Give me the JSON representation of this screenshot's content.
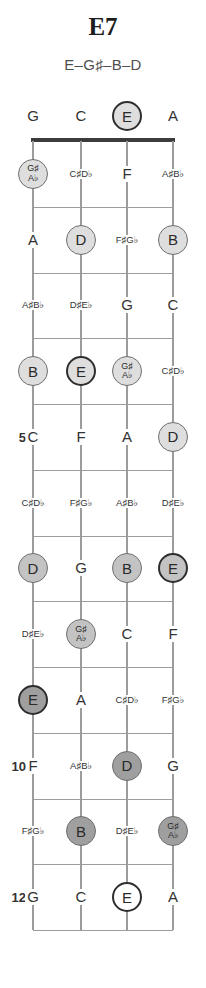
{
  "title": "E7",
  "subtitle": "E–G♯–B–D",
  "colors": {
    "title_text": "#1c1c1c",
    "subtitle_text": "#4f4f4f",
    "text": "#333333",
    "line": "#9c9c9c",
    "nut": "#3c3c3c",
    "light_fill": "#dedede",
    "medium_fill": "#c3c3c3",
    "dark_fill": "#9f9f9f",
    "ring": "#6f6f6f",
    "root_ring": "#2e2e2e"
  },
  "board": {
    "open_row": [
      {
        "lines": [
          "G"
        ],
        "style": "none"
      },
      {
        "lines": [
          "C"
        ],
        "style": "none"
      },
      {
        "lines": [
          "E"
        ],
        "style": "light",
        "root": true
      },
      {
        "lines": [
          "A"
        ],
        "style": "none"
      }
    ],
    "fret_rows": [
      {
        "fret": "1",
        "number": "",
        "cells": [
          {
            "lines": [
              "G♯",
              "A♭"
            ],
            "style": "light"
          },
          {
            "lines": [
              "C♯",
              "D♭"
            ],
            "style": "none"
          },
          {
            "lines": [
              "F"
            ],
            "style": "none"
          },
          {
            "lines": [
              "A♯",
              "B♭"
            ],
            "style": "none"
          }
        ]
      },
      {
        "fret": "2",
        "number": "",
        "cells": [
          {
            "lines": [
              "A"
            ],
            "style": "none"
          },
          {
            "lines": [
              "D"
            ],
            "style": "light"
          },
          {
            "lines": [
              "F♯",
              "G♭"
            ],
            "style": "none"
          },
          {
            "lines": [
              "B"
            ],
            "style": "light"
          }
        ]
      },
      {
        "fret": "3",
        "number": "",
        "cells": [
          {
            "lines": [
              "A♯",
              "B♭"
            ],
            "style": "none"
          },
          {
            "lines": [
              "D♯",
              "E♭"
            ],
            "style": "none"
          },
          {
            "lines": [
              "G"
            ],
            "style": "none"
          },
          {
            "lines": [
              "C"
            ],
            "style": "none"
          }
        ]
      },
      {
        "fret": "4",
        "number": "",
        "cells": [
          {
            "lines": [
              "B"
            ],
            "style": "light"
          },
          {
            "lines": [
              "E"
            ],
            "style": "light",
            "root": true
          },
          {
            "lines": [
              "G♯",
              "A♭"
            ],
            "style": "light"
          },
          {
            "lines": [
              "C♯",
              "D♭"
            ],
            "style": "none"
          }
        ]
      },
      {
        "fret": "5",
        "number": "5",
        "cells": [
          {
            "lines": [
              "C"
            ],
            "style": "none"
          },
          {
            "lines": [
              "F"
            ],
            "style": "none"
          },
          {
            "lines": [
              "A"
            ],
            "style": "none"
          },
          {
            "lines": [
              "D"
            ],
            "style": "light"
          }
        ]
      },
      {
        "fret": "6",
        "number": "",
        "cells": [
          {
            "lines": [
              "C♯",
              "D♭"
            ],
            "style": "none"
          },
          {
            "lines": [
              "F♯",
              "G♭"
            ],
            "style": "none"
          },
          {
            "lines": [
              "A♯",
              "B♭"
            ],
            "style": "none"
          },
          {
            "lines": [
              "D♯",
              "E♭"
            ],
            "style": "none"
          }
        ]
      },
      {
        "fret": "7",
        "number": "7",
        "cells": [
          {
            "lines": [
              "D"
            ],
            "style": "medium"
          },
          {
            "lines": [
              "G"
            ],
            "style": "none"
          },
          {
            "lines": [
              "B"
            ],
            "style": "medium"
          },
          {
            "lines": [
              "E"
            ],
            "style": "medium",
            "root": true
          }
        ]
      },
      {
        "fret": "8",
        "number": "",
        "cells": [
          {
            "lines": [
              "D♯",
              "E♭"
            ],
            "style": "none"
          },
          {
            "lines": [
              "G♯",
              "A♭"
            ],
            "style": "medium"
          },
          {
            "lines": [
              "C"
            ],
            "style": "none"
          },
          {
            "lines": [
              "F"
            ],
            "style": "none"
          }
        ]
      },
      {
        "fret": "9",
        "number": "",
        "cells": [
          {
            "lines": [
              "E"
            ],
            "style": "dark",
            "root": true
          },
          {
            "lines": [
              "A"
            ],
            "style": "none"
          },
          {
            "lines": [
              "C♯",
              "D♭"
            ],
            "style": "none"
          },
          {
            "lines": [
              "F♯",
              "G♭"
            ],
            "style": "none"
          }
        ]
      },
      {
        "fret": "10",
        "number": "10",
        "cells": [
          {
            "lines": [
              "F"
            ],
            "style": "none"
          },
          {
            "lines": [
              "A♯",
              "B♭"
            ],
            "style": "none"
          },
          {
            "lines": [
              "D"
            ],
            "style": "dark"
          },
          {
            "lines": [
              "G"
            ],
            "style": "none"
          }
        ]
      },
      {
        "fret": "11",
        "number": "",
        "cells": [
          {
            "lines": [
              "F♯",
              "G♭"
            ],
            "style": "none"
          },
          {
            "lines": [
              "B"
            ],
            "style": "dark"
          },
          {
            "lines": [
              "D♯",
              "E♭"
            ],
            "style": "none"
          },
          {
            "lines": [
              "G♯",
              "A♭"
            ],
            "style": "dark"
          }
        ]
      },
      {
        "fret": "12",
        "number": "12",
        "cells": [
          {
            "lines": [
              "G"
            ],
            "style": "none"
          },
          {
            "lines": [
              "C"
            ],
            "style": "none"
          },
          {
            "lines": [
              "E"
            ],
            "style": "outline",
            "root": true
          },
          {
            "lines": [
              "A"
            ],
            "style": "none"
          }
        ]
      }
    ]
  }
}
